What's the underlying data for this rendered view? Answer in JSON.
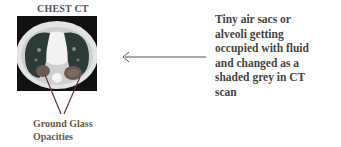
{
  "title": "CHEST CT",
  "image": {
    "subject": "chest-ct-axial-slice",
    "icon": "ct-scan-image"
  },
  "pointer_label": {
    "line1": "Ground Glass",
    "line2": "Opacities"
  },
  "description": {
    "lines": [
      "Tiny air sacs or",
      "alveoli getting",
      "occupied with fluid",
      "and changed as a",
      "shaded grey in CT",
      "scan"
    ]
  },
  "colors": {
    "text_dark": "#444444",
    "label": "#6a5a4a",
    "leader_line": "#5a3b3b",
    "arrow": "#555555"
  }
}
